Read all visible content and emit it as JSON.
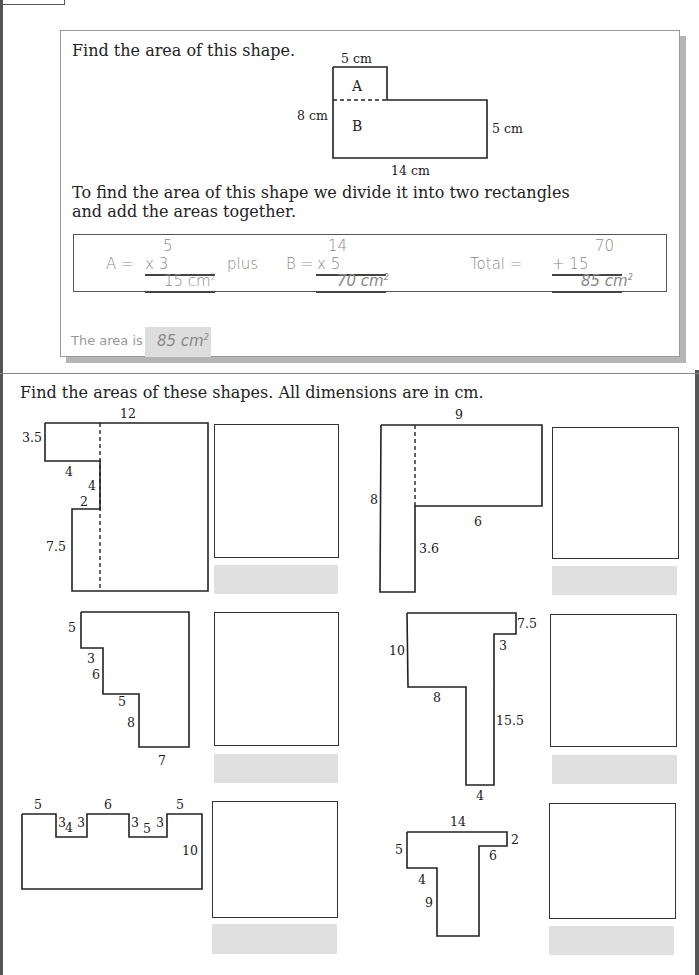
{
  "example": {
    "prompt": "Find the area of this shape.",
    "diagram": {
      "top_label": "5 cm",
      "left_label": "8 cm",
      "right_label": "5 cm",
      "bottom_label": "14 cm",
      "region_a": "A",
      "region_b": "B"
    },
    "explanation_line1": "To find the area of this shape we divide it into two rectangles",
    "explanation_line2": "and add the areas together.",
    "calc": {
      "a_label": "A =",
      "a_top": "5",
      "a_mult": "x    3",
      "a_result": "15 cm",
      "plus_word": "plus",
      "b_label": "B =",
      "b_top": "14",
      "b_mult": "x   5",
      "b_result": "70 cm",
      "total_label": "Total =",
      "total_top": "70",
      "total_add": "+  15",
      "total_result": "85 cm",
      "sup": "2"
    },
    "answer_label": "The area is",
    "answer_value": "85 cm"
  },
  "exercises": {
    "heading": "Find the areas of these shapes. All dimensions are in cm.",
    "shapes": [
      {
        "id": 1,
        "labels": {
          "top": "12",
          "left_top": "3.5",
          "step1": "4",
          "step2": "4",
          "step3": "2",
          "left_bottom": "7.5"
        }
      },
      {
        "id": 2,
        "labels": {
          "top": "9",
          "left": "8",
          "bottom_top": "6",
          "stem": "3.6"
        }
      },
      {
        "id": 3,
        "labels": {
          "s1": "5",
          "s2": "3",
          "s3": "6",
          "s4": "5",
          "s5": "8",
          "s6": "7"
        }
      },
      {
        "id": 4,
        "labels": {
          "right_top": "7.5",
          "inner": "3",
          "left": "10",
          "under": "8",
          "stem": "15.5",
          "bottom": "4"
        }
      },
      {
        "id": 5,
        "labels": {
          "t1": "5",
          "n1a": "3",
          "n1b": "4",
          "n1c": "3",
          "t2": "6",
          "n2a": "3",
          "n2b": "5",
          "n2c": "3",
          "t3": "5",
          "right": "10"
        }
      },
      {
        "id": 6,
        "labels": {
          "top": "14",
          "right": "2",
          "inner": "6",
          "left": "5",
          "under": "4",
          "stem": "9"
        }
      }
    ]
  }
}
